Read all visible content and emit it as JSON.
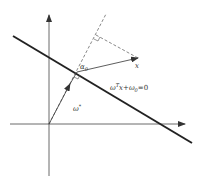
{
  "diagram": {
    "labels": {
      "hyperplane": "ω",
      "hyperplane_sup": "T",
      "hyperplane_rest": "x+ω",
      "hyperplane_sub": "0",
      "hyperplane_eq": "=0",
      "weight_vector": "ω",
      "weight_vector_sup": "*",
      "angle": "α",
      "angle_sub": "0",
      "point": "x"
    },
    "colors": {
      "line": "#222222",
      "axis": "#444444",
      "dashed": "#555555",
      "text": "#333333",
      "background": "#ffffff"
    }
  }
}
